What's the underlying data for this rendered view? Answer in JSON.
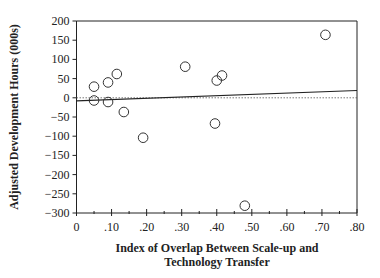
{
  "chart_data": {
    "type": "scatter",
    "title": "",
    "xlabel": [
      "Index of Overlap Between Scale-up and",
      "Technology Transfer"
    ],
    "ylabel": "Adjusted Development Hours (000s)",
    "xlim": [
      0,
      0.8
    ],
    "ylim": [
      -300,
      200
    ],
    "x_ticks": [
      0,
      0.1,
      0.2,
      0.3,
      0.4,
      0.5,
      0.6,
      0.7,
      0.8
    ],
    "x_tick_labels": [
      "0",
      ".10",
      ".20",
      ".30",
      ".40",
      ".50",
      ".60",
      ".70",
      ".80"
    ],
    "y_ticks": [
      200,
      150,
      100,
      50,
      0,
      -50,
      -100,
      -150,
      -200,
      -250,
      -300
    ],
    "y_tick_labels": [
      "200",
      "150",
      "100",
      "50",
      "0",
      "−50",
      "−100",
      "−150",
      "−200",
      "−250",
      "−300"
    ],
    "grid": false,
    "reference_line": {
      "y": 0,
      "style": "dotted"
    },
    "regression_line": {
      "x": [
        0,
        0.8
      ],
      "y": [
        -8,
        19
      ]
    },
    "points": [
      {
        "x": 0.05,
        "y": 29
      },
      {
        "x": 0.05,
        "y": -7
      },
      {
        "x": 0.09,
        "y": 40
      },
      {
        "x": 0.09,
        "y": -11
      },
      {
        "x": 0.115,
        "y": 62
      },
      {
        "x": 0.135,
        "y": -37
      },
      {
        "x": 0.19,
        "y": -104
      },
      {
        "x": 0.31,
        "y": 81
      },
      {
        "x": 0.395,
        "y": -67
      },
      {
        "x": 0.4,
        "y": 45
      },
      {
        "x": 0.415,
        "y": 58
      },
      {
        "x": 0.48,
        "y": -281
      },
      {
        "x": 0.71,
        "y": 164
      }
    ]
  }
}
